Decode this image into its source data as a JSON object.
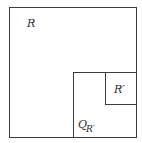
{
  "diagram": {
    "colors": {
      "stroke": "#3a3a3a",
      "text": "#2a2a2a",
      "background": "#ffffff"
    },
    "rects": [
      {
        "id": "R",
        "x": 9,
        "y": 7,
        "w": 127,
        "h": 130
      },
      {
        "id": "Q_R_prime",
        "x": 73,
        "y": 72,
        "w": 63,
        "h": 65
      },
      {
        "id": "R_prime",
        "x": 105,
        "y": 72,
        "w": 31,
        "h": 32
      }
    ],
    "labels": {
      "R": "R",
      "R_prime": "R′",
      "Q": "Q",
      "Q_subscript": "R′"
    }
  }
}
